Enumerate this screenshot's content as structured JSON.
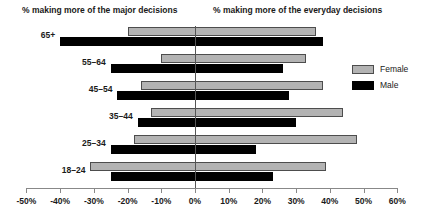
{
  "headers": {
    "left": "% making more of the major decisions",
    "right": "% making more of the everyday decisions"
  },
  "legend": {
    "items": [
      {
        "label": "Female",
        "color": "#b3b3b3"
      },
      {
        "label": "Male",
        "color": "#000000"
      }
    ]
  },
  "chart_data": {
    "type": "bar",
    "orientation": "horizontal",
    "title": "",
    "subtitle": "",
    "xlabel": "",
    "ylabel": "",
    "categories": [
      "65+",
      "55–64",
      "45–54",
      "35–44",
      "25–34",
      "18–24"
    ],
    "series": [
      {
        "name": "Female",
        "color": "#b3b3b3",
        "ranges": [
          {
            "category": "65+",
            "start": -20,
            "end": 36
          },
          {
            "category": "55–64",
            "start": -10,
            "end": 33
          },
          {
            "category": "45–54",
            "start": -16,
            "end": 38
          },
          {
            "category": "35–44",
            "start": -13,
            "end": 44
          },
          {
            "category": "25–34",
            "start": -18,
            "end": 48
          },
          {
            "category": "18–24",
            "start": -31,
            "end": 39
          }
        ]
      },
      {
        "name": "Male",
        "color": "#000000",
        "ranges": [
          {
            "category": "65+",
            "start": -40,
            "end": 38
          },
          {
            "category": "55–64",
            "start": -25,
            "end": 26
          },
          {
            "category": "45–54",
            "start": -23,
            "end": 28
          },
          {
            "category": "35–44",
            "start": -17,
            "end": 30
          },
          {
            "category": "25–34",
            "start": -25,
            "end": 18
          },
          {
            "category": "18–24",
            "start": -25,
            "end": 23
          }
        ]
      }
    ],
    "xlim": [
      -50,
      60
    ],
    "xticks": [
      -50,
      -40,
      -30,
      -20,
      -10,
      0,
      10,
      20,
      30,
      40,
      50,
      60
    ],
    "xticklabels": [
      "-50%",
      "-40%",
      "-30%",
      "-20%",
      "-10%",
      "0%",
      "10%",
      "20%",
      "30%",
      "40%",
      "50%",
      "60%"
    ],
    "grid": false,
    "zero_line": true,
    "legend_position": "right"
  }
}
